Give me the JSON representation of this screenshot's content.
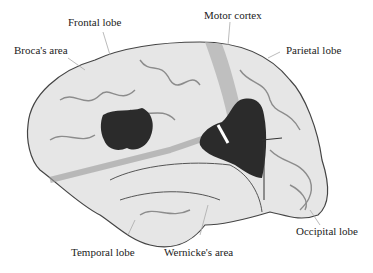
{
  "diagram": {
    "labels": {
      "frontal_lobe": "Frontal lobe",
      "motor_cortex": "Motor cortex",
      "brocas_area": "Broca's area",
      "parietal_lobe": "Parietal lobe",
      "temporal_lobe": "Temporal lobe",
      "wernickes_area": "Wernicke's area",
      "occipital_lobe": "Occipital lobe"
    },
    "colors": {
      "brain_fill": "#e6e6e6",
      "sulci": "#8c8c8c",
      "highlight_areas": "#2b2b2b",
      "motor_strip": "#b5b5b5",
      "leader_lines": "#aaaaaa"
    }
  }
}
